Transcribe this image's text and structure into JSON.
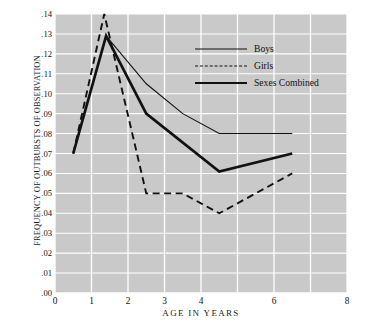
{
  "chart_data": {
    "type": "line",
    "title": "",
    "xlabel": "AGE IN YEARS",
    "ylabel": "FREQUENCY OF OUTBURSTS OF OBSERVATION",
    "xlim": [
      0,
      8
    ],
    "ylim": [
      0.0,
      0.14
    ],
    "grid": true,
    "grid_color": "#ffffff",
    "plot_background": "#c9c9c9",
    "legend_position": "upper-right-inside",
    "xticks": [
      0,
      1,
      2,
      3,
      4,
      6,
      8
    ],
    "xtick_labels": [
      "0",
      "1",
      "2",
      "3",
      "4",
      "6",
      "8"
    ],
    "yticks": [
      0.0,
      0.01,
      0.02,
      0.03,
      0.04,
      0.05,
      0.06,
      0.07,
      0.08,
      0.09,
      0.1,
      0.11,
      0.12,
      0.13,
      0.14
    ],
    "ytick_labels": [
      ".00",
      ".01",
      ".02",
      ".03",
      ".04",
      ".05",
      ".06",
      ".07",
      ".08",
      ".09",
      ".10",
      ".11",
      ".12",
      ".13",
      ".14"
    ],
    "series": [
      {
        "name": "Boys",
        "style": "solid-thin",
        "color": "#111111",
        "x": [
          0.5,
          1.4,
          2.5,
          3.5,
          4.5,
          6.5
        ],
        "values": [
          0.07,
          0.129,
          0.105,
          0.09,
          0.08,
          0.08
        ]
      },
      {
        "name": "Girls",
        "style": "dashed",
        "color": "#111111",
        "x": [
          0.5,
          1.35,
          2.5,
          3.5,
          4.5,
          6.5
        ],
        "values": [
          0.07,
          0.14,
          0.05,
          0.05,
          0.04,
          0.06
        ]
      },
      {
        "name": "Sexes Combined",
        "style": "solid-thick",
        "color": "#111111",
        "x": [
          0.5,
          1.4,
          2.5,
          4.5,
          6.5
        ],
        "values": [
          0.07,
          0.129,
          0.09,
          0.061,
          0.07
        ]
      }
    ]
  },
  "legend": {
    "items": [
      {
        "label": "Boys",
        "swatch": "thin-solid-line-icon"
      },
      {
        "label": "Girls",
        "swatch": "dashed-line-icon"
      },
      {
        "label": "Sexes Combined",
        "swatch": "thick-solid-line-icon"
      }
    ]
  }
}
